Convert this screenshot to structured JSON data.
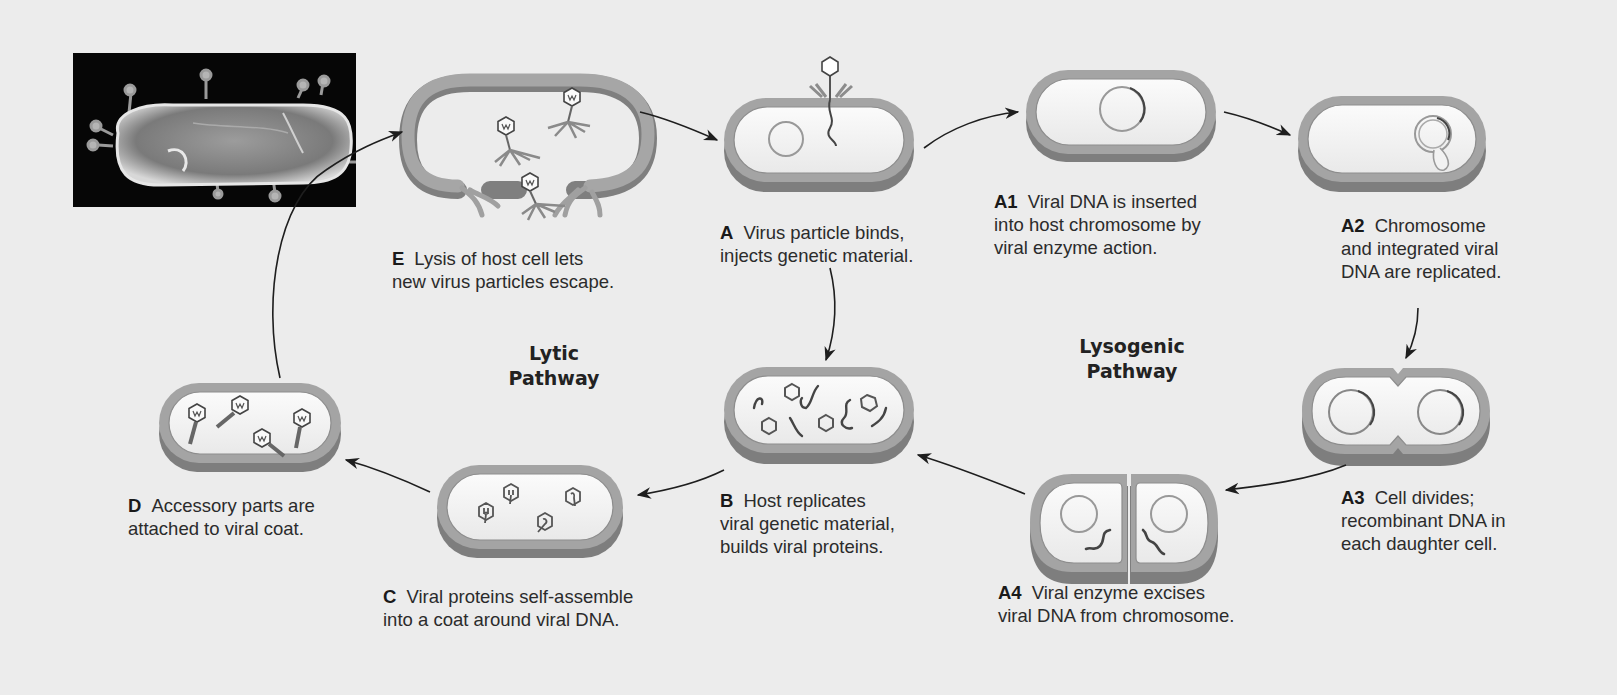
{
  "diagram": {
    "photo": {
      "label": "micrograph-bacterium-with-phages"
    },
    "pathways": {
      "lytic": {
        "line1": "Lytic",
        "line2": "Pathway"
      },
      "lysogenic": {
        "line1": "Lysogenic",
        "line2": "Pathway"
      }
    },
    "steps": {
      "A": {
        "tag": "A",
        "line1": "Virus particle binds,",
        "line2": "injects genetic material."
      },
      "A1": {
        "tag": "A1",
        "line1": "Viral DNA is inserted",
        "line2": "into host chromosome by",
        "line3": "viral enzyme action."
      },
      "A2": {
        "tag": "A2",
        "line1": "Chromosome",
        "line2": "and integrated viral",
        "line3": "DNA are replicated."
      },
      "A3": {
        "tag": "A3",
        "line1": "Cell divides;",
        "line2": "recombinant DNA in",
        "line3": "each daughter cell."
      },
      "A4": {
        "tag": "A4",
        "line1": "Viral enzyme excises",
        "line2": "viral DNA from chromosome."
      },
      "B": {
        "tag": "B",
        "line1": "Host replicates",
        "line2": "viral genetic material,",
        "line3": "builds viral proteins."
      },
      "C": {
        "tag": "C",
        "line1": "Viral proteins self-assemble",
        "line2": "into a coat around viral DNA."
      },
      "D": {
        "tag": "D",
        "line1": "Accessory parts are",
        "line2": "attached to viral coat."
      },
      "E": {
        "tag": "E",
        "line1": "Lysis of host cell lets",
        "line2": "new virus particles escape."
      }
    },
    "colors": {
      "background": "#ececec",
      "cell_wall": "#9a9a9a",
      "cell_wall_shadow": "#7c7c7c",
      "cell_interior": "#f4f4f4",
      "dna": "#555555",
      "arrow": "#1e1e1e"
    }
  }
}
